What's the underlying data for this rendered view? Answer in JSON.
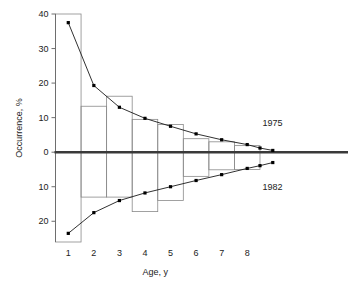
{
  "chart_data": {
    "type": "bar",
    "title": "",
    "subtitle": "",
    "xlabel": "Age, y",
    "ylabel": "Occurrence, %",
    "categories": [
      1,
      2,
      3,
      4,
      5,
      6,
      7,
      8
    ],
    "x_tick_labels": [
      "1",
      "2",
      "3",
      "4",
      "5",
      "6",
      "7",
      "8"
    ],
    "y_tick_labels": [
      "40",
      "30",
      "20",
      "10",
      "0",
      "10",
      "20"
    ],
    "y_tick_values": [
      40,
      30,
      20,
      10,
      0,
      -10,
      -20
    ],
    "ylim": [
      -27,
      41
    ],
    "xlim": [
      0.5,
      9.4
    ],
    "grid": false,
    "legend_position": "right-inline",
    "zero_line": 0,
    "note": "Back-to-back age-frequency histogram. Boxes span from the 1975 value (up, positive) to the 1982 value (down, negative) for each age class; two point-and-line series trace the same values.",
    "series": [
      {
        "name": "1975",
        "direction": "up",
        "marker": "square",
        "color": "#000000",
        "x": [
          1,
          2,
          3,
          4,
          5,
          6,
          7,
          8,
          8.5,
          9.0
        ],
        "values": [
          37.5,
          19.3,
          13.0,
          9.8,
          7.5,
          5.3,
          3.6,
          2.2,
          1.2,
          0.5
        ]
      },
      {
        "name": "1982",
        "direction": "down",
        "marker": "square",
        "color": "#000000",
        "x": [
          1,
          2,
          3,
          4,
          5,
          6,
          7,
          8,
          8.5,
          9.0
        ],
        "values": [
          -23.5,
          -17.5,
          -14.0,
          -11.8,
          -10.0,
          -8.2,
          -6.5,
          -4.7,
          -3.9,
          -3.0
        ]
      }
    ],
    "bars": [
      {
        "age": 1,
        "top": 40.0,
        "bottom": -26.0
      },
      {
        "age": 2,
        "top": 13.3,
        "bottom": -13.0
      },
      {
        "age": 3,
        "top": 16.2,
        "bottom": -13.0
      },
      {
        "age": 4,
        "top": 9.5,
        "bottom": -17.2
      },
      {
        "age": 5,
        "top": 8.0,
        "bottom": -14.0
      },
      {
        "age": 6,
        "top": 3.9,
        "bottom": -7.0
      },
      {
        "age": 7,
        "top": 3.0,
        "bottom": -5.1
      },
      {
        "age": 8,
        "top": 1.9,
        "bottom": -5.0
      }
    ],
    "annotations": [
      {
        "text": "1975",
        "x": 8.6,
        "y": 8.5
      },
      {
        "text": "1982",
        "x": 8.6,
        "y": -10.0
      }
    ],
    "colors": {
      "axis": "#6e6e6e",
      "zero_line": "#3a3a3a",
      "bar_stroke": "#8a8a8a",
      "series_line": "#1a1a1a",
      "marker": "#000000",
      "background": "#ffffff",
      "text": "#222222"
    }
  }
}
